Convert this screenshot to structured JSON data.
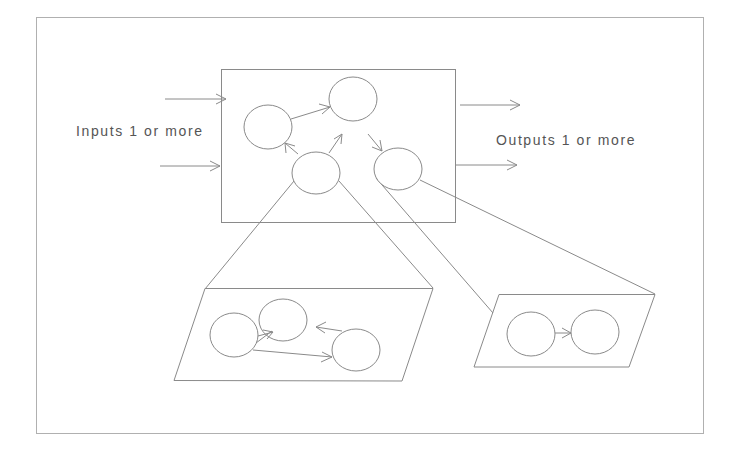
{
  "diagram": {
    "inputs_label": "Inputs 1 or more",
    "outputs_label": "Outputs 1 or more",
    "colors": {
      "line": "#8a8a8a",
      "frame": "#b0b0b0",
      "text": "#555555",
      "background": "#ffffff"
    },
    "outer_frame": {
      "x": 36,
      "y": 17,
      "w": 667,
      "h": 416
    },
    "main_box": {
      "x": 221,
      "y": 69,
      "w": 234,
      "h": 153,
      "nodes": [
        {
          "id": "A",
          "cx": 268,
          "cy": 127,
          "rx": 24,
          "ry": 22
        },
        {
          "id": "B",
          "cx": 353,
          "cy": 99,
          "rx": 24,
          "ry": 22
        },
        {
          "id": "C",
          "cx": 316,
          "cy": 173,
          "rx": 24,
          "ry": 21
        },
        {
          "id": "D",
          "cx": 398,
          "cy": 169,
          "rx": 24,
          "ry": 21
        }
      ],
      "edges": [
        {
          "from": "A",
          "to": "B"
        },
        {
          "from": "C",
          "to": "B"
        },
        {
          "from": "C",
          "to": "A"
        },
        {
          "from": "B",
          "to": "D"
        }
      ]
    },
    "input_arrows": 2,
    "output_arrows": 2,
    "subnet_left": {
      "expands_node": "C",
      "nodes": [
        {
          "id": "L1",
          "cx": 234,
          "cy": 335,
          "rx": 24,
          "ry": 22
        },
        {
          "id": "L2",
          "cx": 283,
          "cy": 320,
          "rx": 24,
          "ry": 21
        },
        {
          "id": "L3",
          "cx": 356,
          "cy": 350,
          "rx": 24,
          "ry": 21
        }
      ],
      "edges": [
        {
          "from": "L1",
          "to": "L2"
        },
        {
          "from": "L3",
          "to": "L2"
        },
        {
          "from": "L1",
          "to": "L3"
        }
      ]
    },
    "subnet_right": {
      "expands_node": "D",
      "nodes": [
        {
          "id": "R1",
          "cx": 531,
          "cy": 334,
          "rx": 24,
          "ry": 22
        },
        {
          "id": "R2",
          "cx": 595,
          "cy": 332,
          "rx": 24,
          "ry": 22
        }
      ],
      "edges": [
        {
          "from": "R1",
          "to": "R2"
        }
      ]
    }
  }
}
